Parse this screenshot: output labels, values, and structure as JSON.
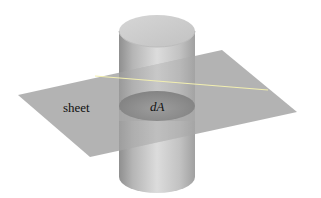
{
  "figure": {
    "labels": {
      "sheet": "sheet",
      "area_element": "dA"
    },
    "colors": {
      "background": "#ffffff",
      "sheet": "#a9a9a9",
      "cylinder_dark": "#8f8f8f",
      "cylinder_light": "#dcdcdc",
      "cylinder_top": "#c9c9c9",
      "cross_section": "#8c8c8c",
      "intersection_line": "#f2efb0",
      "text": "#111111"
    }
  }
}
